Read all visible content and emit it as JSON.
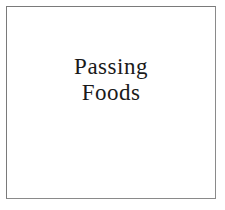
{
  "card": {
    "title_lines": [
      "Passing",
      "Foods"
    ]
  }
}
